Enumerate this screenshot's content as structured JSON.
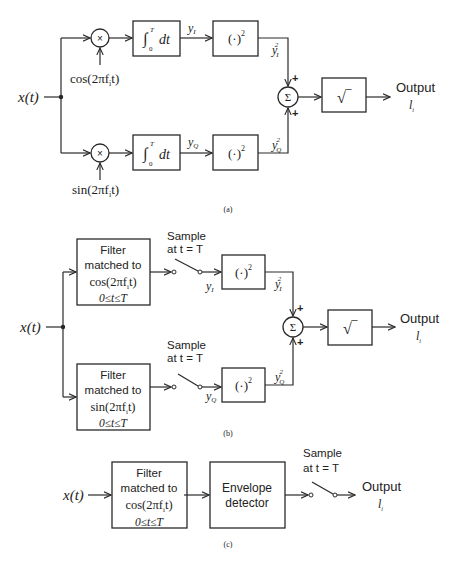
{
  "diagram": {
    "panel_a": {
      "caption": "(a)",
      "input_label": "x(t)",
      "mixer_symbol": "×",
      "cos_ref": "cos(2πf",
      "sin_ref": "sin(2πf",
      "ref_sub": "i",
      "ref_tail": "t)",
      "integrator_prefix": "∫",
      "integrator_upper": "T",
      "integrator_lower": "0",
      "integrator_body": "dt",
      "y_var": "y",
      "i_sub": "I",
      "q_sub": "Q",
      "square_op": "(·)",
      "exp2": "2",
      "sum_symbol": "Σ",
      "plus": "+",
      "sqrt_symbol": "√‾",
      "output_label": "Output",
      "output_var": "l",
      "output_sub": "i"
    },
    "panel_b": {
      "caption": "(b)",
      "input_label": "x(t)",
      "filter_line1": "Filter",
      "filter_line2": "matched to",
      "filter_cos": "cos(2πf",
      "filter_sin": "sin(2πf",
      "ref_sub": "i",
      "ref_tail": "t)",
      "filter_range": "0≤t≤T",
      "sample_line1": "Sample",
      "sample_line2": "at t = T",
      "y_var": "y",
      "i_sub": "I",
      "q_sub": "Q",
      "square_op": "(·)",
      "exp2": "2",
      "sum_symbol": "Σ",
      "plus": "+",
      "sqrt_symbol": "√‾",
      "output_label": "Output",
      "output_var": "l",
      "output_sub": "i"
    },
    "panel_c": {
      "caption": "(c)",
      "input_label": "x(t)",
      "filter_line1": "Filter",
      "filter_line2": "matched to",
      "filter_cos": "cos(2πf",
      "ref_sub": "i",
      "ref_tail": "t)",
      "filter_range": "0≤t≤T",
      "envelope_line1": "Envelope",
      "envelope_line2": "detector",
      "sample_line1": "Sample",
      "sample_line2": "at t = T",
      "output_label": "Output",
      "output_var": "l",
      "output_sub": "i"
    }
  }
}
